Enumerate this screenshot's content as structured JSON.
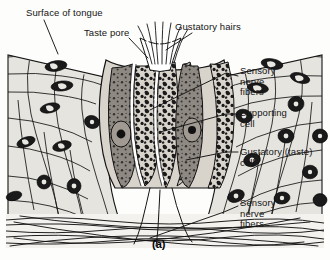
{
  "figure": {
    "caption": "(a)",
    "background_color": "#fdfdfb",
    "ink_color": "#141414"
  },
  "labels": [
    {
      "id": "surface-of-tongue",
      "text": "Surface of tongue",
      "x": 26,
      "y": 8,
      "align": "left"
    },
    {
      "id": "taste-pore",
      "text": "Taste pore",
      "x": 84,
      "y": 28,
      "align": "left"
    },
    {
      "id": "gustatory-hairs",
      "text": "Gustatory hairs",
      "x": 175,
      "y": 22,
      "align": "left"
    },
    {
      "id": "sensory-nerve-fibers-upper",
      "text": "Sensory\nnerve\nfibers",
      "x": 240,
      "y": 66,
      "align": "left"
    },
    {
      "id": "supporting-cell",
      "text": "Supporting\ncell",
      "x": 240,
      "y": 108,
      "align": "left"
    },
    {
      "id": "gustatory-taste-cell",
      "text": "Gustatory (taste)\ncell",
      "x": 240,
      "y": 147,
      "align": "left"
    },
    {
      "id": "sensory-nerve-fibers-lower",
      "text": "Sensory\nnerve\nfibers",
      "x": 240,
      "y": 198,
      "align": "left"
    }
  ],
  "structures": [
    {
      "id": "epithelium-left",
      "name": "stratified squamous epithelium (left)",
      "fill": "#e6e4df"
    },
    {
      "id": "epithelium-right",
      "name": "stratified squamous epithelium (right)",
      "fill": "#e6e4df"
    },
    {
      "id": "taste-bud",
      "name": "taste bud",
      "fill": "#d8d4cc"
    },
    {
      "id": "gustatory-cell",
      "name": "gustatory (taste) cell",
      "fill": "#8e8983"
    },
    {
      "id": "supporting-cell",
      "name": "supporting cell",
      "fill": "#cfcac1"
    },
    {
      "id": "taste-pore-opening",
      "name": "taste pore",
      "fill": "#ffffff"
    },
    {
      "id": "gustatory-hair-tufts",
      "name": "gustatory hairs",
      "fill": "#ffffff"
    },
    {
      "id": "nerve-fiber-layer",
      "name": "sensory nerve fiber layer",
      "fill": "#f2f0ec"
    }
  ]
}
